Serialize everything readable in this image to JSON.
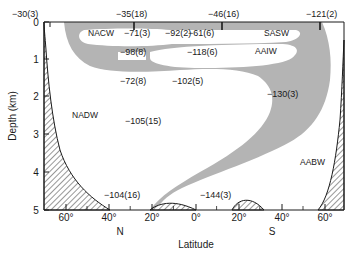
{
  "figure": {
    "x_axis": {
      "title": "Latitude",
      "ticks": [
        {
          "label": "60°",
          "x": 66
        },
        {
          "label": "40°",
          "x": 109
        },
        {
          "label": "20°",
          "x": 152
        },
        {
          "label": "0°",
          "x": 196
        },
        {
          "label": "20°",
          "x": 239
        },
        {
          "label": "40°",
          "x": 282
        },
        {
          "label": "60°",
          "x": 325
        }
      ],
      "hemisphere_labels": [
        {
          "label": "N",
          "x": 120
        },
        {
          "label": "S",
          "x": 272
        }
      ]
    },
    "y_axis": {
      "title": "Depth (km)",
      "ticks": [
        {
          "label": "0",
          "y": 22
        },
        {
          "label": "1",
          "y": 59
        },
        {
          "label": "2",
          "y": 96
        },
        {
          "label": "3",
          "y": 134
        },
        {
          "label": "4",
          "y": 172
        },
        {
          "label": "5",
          "y": 210
        }
      ]
    },
    "water_masses": [
      {
        "label": "NACW",
        "x": 88,
        "y": 36
      },
      {
        "label": "SASW",
        "x": 264,
        "y": 36
      },
      {
        "label": "AAIW",
        "x": 255,
        "y": 54
      },
      {
        "label": "NADW",
        "x": 72,
        "y": 118
      },
      {
        "label": "AABW",
        "x": 300,
        "y": 165
      }
    ],
    "station_values": [
      {
        "label": "-30(3)",
        "x": 12,
        "y": 17
      },
      {
        "label": "-35(18)",
        "x": 116,
        "y": 17
      },
      {
        "label": "-46(16)",
        "x": 208,
        "y": 17
      },
      {
        "label": "-121(2)",
        "x": 306,
        "y": 17
      },
      {
        "label": "-71(3)",
        "x": 124,
        "y": 36
      },
      {
        "label": "-92(2)",
        "x": 165,
        "y": 36
      },
      {
        "label": "-61(6)",
        "x": 188,
        "y": 36
      },
      {
        "label": "-98(8)",
        "x": 120,
        "y": 55
      },
      {
        "label": "-118(6)",
        "x": 187,
        "y": 55
      },
      {
        "label": "-72(8)",
        "x": 120,
        "y": 84
      },
      {
        "label": "-102(5)",
        "x": 172,
        "y": 84
      },
      {
        "label": "-130(3)",
        "x": 267,
        "y": 97
      },
      {
        "label": "-105(15)",
        "x": 125,
        "y": 124
      },
      {
        "label": "-104(16)",
        "x": 104,
        "y": 198
      },
      {
        "label": "-144(3)",
        "x": 200,
        "y": 198
      }
    ],
    "colors": {
      "water_mass_shading": "#b4b4b4",
      "topography_hatch": "#1a1a1a",
      "axis": "#1a1a1a",
      "background": "#ffffff"
    }
  }
}
